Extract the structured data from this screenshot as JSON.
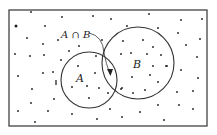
{
  "diagram": {
    "type": "venn",
    "frame": {
      "x": 9,
      "y": 10,
      "width": 198,
      "height": 116,
      "stroke": "#333333"
    },
    "sets": [
      {
        "name": "A",
        "label": "A",
        "cx": 89,
        "cy": 80,
        "r": 28,
        "label_x": 76,
        "label_y": 82
      },
      {
        "name": "B",
        "label": "B",
        "cx": 138,
        "cy": 63,
        "r": 36,
        "label_x": 133,
        "label_y": 68
      }
    ],
    "intersection": {
      "label": "A ∩ B",
      "label_x": 61,
      "label_y": 38,
      "arrow_path": "M 89 33 Q 103 36 104 53 Q 106 64 110 74"
    },
    "dot_color": "#222222",
    "points": [
      [
        31,
        12
      ],
      [
        62,
        17
      ],
      [
        93,
        16
      ],
      [
        111,
        19
      ],
      [
        149,
        14
      ],
      [
        181,
        20
      ],
      [
        202,
        19
      ],
      [
        16,
        26
      ],
      [
        45,
        26
      ],
      [
        127,
        26
      ],
      [
        158,
        28
      ],
      [
        178,
        33
      ],
      [
        200,
        39
      ],
      [
        186,
        45
      ],
      [
        27,
        38
      ],
      [
        43,
        44
      ],
      [
        58,
        40
      ],
      [
        102,
        40
      ],
      [
        123,
        41
      ],
      [
        143,
        40
      ],
      [
        153,
        47
      ],
      [
        15,
        54
      ],
      [
        30,
        56
      ],
      [
        44,
        55
      ],
      [
        69,
        51
      ],
      [
        79,
        46
      ],
      [
        61,
        60
      ],
      [
        96,
        56
      ],
      [
        121,
        54
      ],
      [
        131,
        53
      ],
      [
        147,
        54
      ],
      [
        161,
        55
      ],
      [
        197,
        57
      ],
      [
        18,
        76
      ],
      [
        43,
        73
      ],
      [
        53,
        72
      ],
      [
        78,
        66
      ],
      [
        95,
        73
      ],
      [
        153,
        66
      ],
      [
        167,
        66
      ],
      [
        166,
        66
      ],
      [
        181,
        70
      ],
      [
        198,
        78
      ],
      [
        132,
        77
      ],
      [
        150,
        75
      ],
      [
        158,
        82
      ],
      [
        72,
        87
      ],
      [
        87,
        86
      ],
      [
        99,
        88
      ],
      [
        108,
        93
      ],
      [
        121,
        89
      ],
      [
        122,
        88
      ],
      [
        133,
        93
      ],
      [
        145,
        90
      ],
      [
        32,
        89
      ],
      [
        54,
        99
      ],
      [
        89,
        98
      ],
      [
        31,
        103
      ],
      [
        177,
        92
      ],
      [
        193,
        91
      ],
      [
        158,
        105
      ],
      [
        179,
        105
      ],
      [
        193,
        109
      ],
      [
        18,
        111
      ],
      [
        48,
        111
      ],
      [
        72,
        114
      ],
      [
        110,
        109
      ],
      [
        140,
        112
      ],
      [
        97,
        119
      ],
      [
        122,
        117
      ],
      [
        164,
        120
      ],
      [
        35,
        122
      ]
    ],
    "tick_mark": {
      "x": 56,
      "y1": 80,
      "y2": 85
    }
  }
}
